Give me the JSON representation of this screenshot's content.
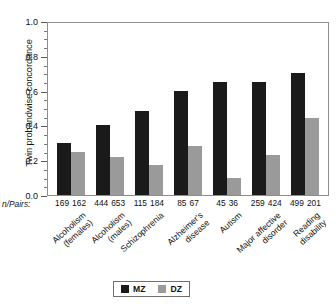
{
  "chart_data": {
    "type": "bar",
    "title": "",
    "xlabel": "",
    "ylabel": "Twin probandwise concordance",
    "ylim": [
      0.0,
      1.0
    ],
    "ytick_labels": [
      "0.0",
      "0.2",
      "0.4",
      "0.6",
      "0.8",
      "1.0"
    ],
    "ytick_values": [
      0.0,
      0.2,
      0.4,
      0.6,
      0.8,
      1.0
    ],
    "grid": false,
    "legend_position": "bottom-center",
    "categories": [
      "Alcoholism (females)",
      "Alcoholism (males)",
      "Schizophrenia",
      "Alzheimer's disease",
      "Autism",
      "Major affective disorder",
      "Reading disability"
    ],
    "category_lines": [
      [
        "Alcoholism",
        "(females)"
      ],
      [
        "Alcoholism",
        "(males)"
      ],
      [
        "Schizophrenia"
      ],
      [
        "Alzheimer's",
        "disease"
      ],
      [
        "Autism"
      ],
      [
        "Major affective",
        "disorder"
      ],
      [
        "Reading",
        "disability"
      ]
    ],
    "series": [
      {
        "name": "MZ",
        "color": "#1a1a1a",
        "values": [
          0.3,
          0.4,
          0.48,
          0.6,
          0.65,
          0.65,
          0.7
        ]
      },
      {
        "name": "DZ",
        "color": "#9a9a9a",
        "values": [
          0.25,
          0.22,
          0.17,
          0.28,
          0.1,
          0.23,
          0.44
        ]
      }
    ],
    "npairs_row_label": "n/Pairs:",
    "npairs": [
      {
        "mz": "169",
        "dz": "162"
      },
      {
        "mz": "444",
        "dz": "653"
      },
      {
        "mz": "115",
        "dz": "184"
      },
      {
        "mz": "85",
        "dz": "67"
      },
      {
        "mz": "45",
        "dz": "36"
      },
      {
        "mz": "259",
        "dz": "424"
      },
      {
        "mz": "499",
        "dz": "201"
      }
    ],
    "legend": [
      {
        "label": "MZ",
        "color": "#1a1a1a"
      },
      {
        "label": "DZ",
        "color": "#9a9a9a"
      }
    ]
  }
}
